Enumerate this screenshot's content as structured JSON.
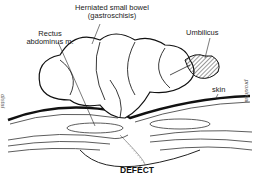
{
  "figure": {
    "labels": {
      "herniated_line1": "Herniated small bowel",
      "herniated_line2": "(gastroschisis)",
      "rectus_line1": "Rectus",
      "rectus_line2": "abdominus m.",
      "umbilicus": "Umbilicus",
      "skin": "skin",
      "defect": "DEFECT",
      "distal": "distal",
      "proximal": "proximal"
    },
    "colors": {
      "ink": "#222222",
      "background": "#ffffff",
      "side_label": "#666666"
    }
  }
}
